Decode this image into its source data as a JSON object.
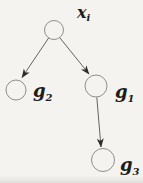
{
  "figure": {
    "type": "tree-diagram",
    "background_color": "#f4f3ef",
    "circle_stroke_color": "#8f8f8f",
    "edge_color": "#555250",
    "text_color": "#1d1c1a",
    "nodes": [
      {
        "id": "root",
        "label_base": "x",
        "label_sub": "i"
      },
      {
        "id": "left-child",
        "label_base": "g",
        "label_sub": "2"
      },
      {
        "id": "right-child",
        "label_base": "g",
        "label_sub": "1"
      },
      {
        "id": "grandchild",
        "label_base": "g",
        "label_sub": "3"
      }
    ],
    "edges": [
      {
        "from": "root",
        "to": "left-child"
      },
      {
        "from": "root",
        "to": "right-child"
      },
      {
        "from": "right-child",
        "to": "grandchild"
      }
    ]
  }
}
